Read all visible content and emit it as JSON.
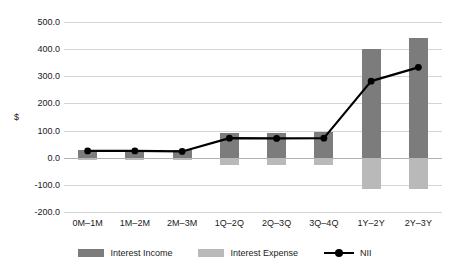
{
  "chart_data": {
    "type": "bar",
    "title": "",
    "xlabel": "",
    "ylabel": "$",
    "ylim": [
      -200,
      500
    ],
    "ytick_step": 100,
    "ytick_labels": [
      "500.0",
      "400.0",
      "300.0",
      "200.0",
      "100.0",
      "0.0",
      "-100.0",
      "-200.0"
    ],
    "ytick_values": [
      500,
      400,
      300,
      200,
      100,
      0,
      -100,
      -200
    ],
    "grid": true,
    "legend_position": "bottom",
    "categories": [
      "0M–1M",
      "1M–2M",
      "2M–3M",
      "1Q–2Q",
      "2Q–3Q",
      "3Q–4Q",
      "1Y–2Y",
      "2Y–3Y"
    ],
    "series": [
      {
        "name": "Interest Income",
        "type": "bar",
        "color": "#7c7c7c",
        "values": [
          30,
          30,
          28,
          92,
          92,
          95,
          400,
          440
        ]
      },
      {
        "name": "Interest Expense",
        "type": "bar",
        "color": "#b9b9b9",
        "values": [
          -7,
          -7,
          -7,
          -27,
          -27,
          -28,
          -115,
          -115
        ]
      },
      {
        "name": "NII",
        "type": "line",
        "color": "#000000",
        "marker": "circle",
        "values": [
          25,
          25,
          23,
          72,
          71,
          72,
          282,
          333
        ]
      }
    ]
  },
  "legend": {
    "items": [
      {
        "label": "Interest Income",
        "swatch": "income-swatch"
      },
      {
        "label": "Interest Expense",
        "swatch": "expense-swatch"
      },
      {
        "label": "NII",
        "swatch": "line-marker-swatch"
      }
    ]
  }
}
